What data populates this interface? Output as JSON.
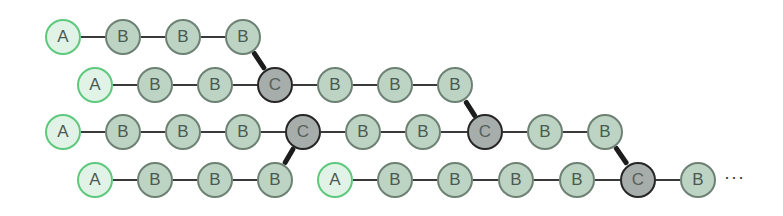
{
  "diagram": {
    "radius": 18,
    "colors": {
      "A_fill": "#e1f3e7",
      "A_border": "#5ec97c",
      "B_fill": "#bdd4c5",
      "B_border": "#6d8174",
      "C_fill": "#a7adaa",
      "C_border": "#262626",
      "edge": "#3a3a3a",
      "branch_edge": "#1c1c1c"
    },
    "rows": [
      {
        "y": 37,
        "nodes": [
          {
            "label": "A",
            "x": 63
          },
          {
            "label": "B",
            "x": 123
          },
          {
            "label": "B",
            "x": 183
          },
          {
            "label": "B",
            "x": 243
          }
        ]
      },
      {
        "y": 85,
        "nodes": [
          {
            "label": "A",
            "x": 95
          },
          {
            "label": "B",
            "x": 155
          },
          {
            "label": "B",
            "x": 215
          },
          {
            "label": "C",
            "x": 275
          },
          {
            "label": "B",
            "x": 335
          },
          {
            "label": "B",
            "x": 395
          },
          {
            "label": "B",
            "x": 455
          }
        ]
      },
      {
        "y": 132,
        "nodes": [
          {
            "label": "A",
            "x": 63
          },
          {
            "label": "B",
            "x": 123
          },
          {
            "label": "B",
            "x": 183
          },
          {
            "label": "B",
            "x": 243
          },
          {
            "label": "C",
            "x": 303
          },
          {
            "label": "B",
            "x": 363
          },
          {
            "label": "B",
            "x": 423
          },
          {
            "label": "C",
            "x": 485
          },
          {
            "label": "B",
            "x": 545
          },
          {
            "label": "B",
            "x": 605
          }
        ]
      },
      {
        "y": 180,
        "nodes": [
          {
            "label": "A",
            "x": 95
          },
          {
            "label": "B",
            "x": 155
          },
          {
            "label": "B",
            "x": 215
          },
          {
            "label": "B",
            "x": 275
          },
          {
            "label": "A",
            "x": 335
          },
          {
            "label": "B",
            "x": 395
          },
          {
            "label": "B",
            "x": 455
          },
          {
            "label": "B",
            "x": 516
          },
          {
            "label": "B",
            "x": 577
          },
          {
            "label": "C",
            "x": 638
          },
          {
            "label": "B",
            "x": 698
          }
        ]
      }
    ],
    "horizontal_edges": [
      {
        "row": 0,
        "from": 0,
        "to": 1
      },
      {
        "row": 0,
        "from": 1,
        "to": 2
      },
      {
        "row": 0,
        "from": 2,
        "to": 3
      },
      {
        "row": 1,
        "from": 0,
        "to": 1
      },
      {
        "row": 1,
        "from": 1,
        "to": 2
      },
      {
        "row": 1,
        "from": 2,
        "to": 3
      },
      {
        "row": 1,
        "from": 3,
        "to": 4
      },
      {
        "row": 1,
        "from": 4,
        "to": 5
      },
      {
        "row": 1,
        "from": 5,
        "to": 6
      },
      {
        "row": 2,
        "from": 0,
        "to": 1
      },
      {
        "row": 2,
        "from": 1,
        "to": 2
      },
      {
        "row": 2,
        "from": 2,
        "to": 3
      },
      {
        "row": 2,
        "from": 3,
        "to": 4
      },
      {
        "row": 2,
        "from": 4,
        "to": 5
      },
      {
        "row": 2,
        "from": 5,
        "to": 6
      },
      {
        "row": 2,
        "from": 6,
        "to": 7
      },
      {
        "row": 2,
        "from": 7,
        "to": 8
      },
      {
        "row": 2,
        "from": 8,
        "to": 9
      },
      {
        "row": 3,
        "from": 0,
        "to": 1
      },
      {
        "row": 3,
        "from": 1,
        "to": 2
      },
      {
        "row": 3,
        "from": 2,
        "to": 3
      },
      {
        "row": 3,
        "from": 4,
        "to": 5
      },
      {
        "row": 3,
        "from": 5,
        "to": 6
      },
      {
        "row": 3,
        "from": 6,
        "to": 7
      },
      {
        "row": 3,
        "from": 7,
        "to": 8
      },
      {
        "row": 3,
        "from": 8,
        "to": 9
      },
      {
        "row": 3,
        "from": 9,
        "to": 10
      }
    ],
    "branch_edges": [
      {
        "from": [
          0,
          3
        ],
        "to": [
          1,
          3
        ]
      },
      {
        "from": [
          1,
          6
        ],
        "to": [
          2,
          7
        ]
      },
      {
        "from": [
          3,
          3
        ],
        "to": [
          2,
          4
        ]
      },
      {
        "from": [
          2,
          9
        ],
        "to": [
          3,
          9
        ]
      }
    ],
    "ellipsis": {
      "text": "···",
      "x": 724,
      "y": 180
    }
  }
}
